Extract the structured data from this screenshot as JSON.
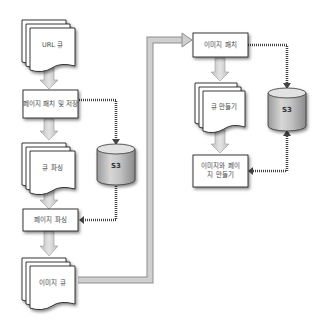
{
  "diagram": {
    "left": {
      "url_queue": "URL 큐",
      "fetch_store": "페이지 패치 및 저장",
      "parse_queue": "큐 파싱",
      "page_parse": "페이지 파싱",
      "image_queue": "이미지 큐",
      "storage": "S3"
    },
    "right": {
      "image_fetch": "이미지 패치",
      "make_queue": "큐 만들기",
      "make_images_pages": "이미지와 페이지 만들기",
      "storage": "S3"
    }
  }
}
